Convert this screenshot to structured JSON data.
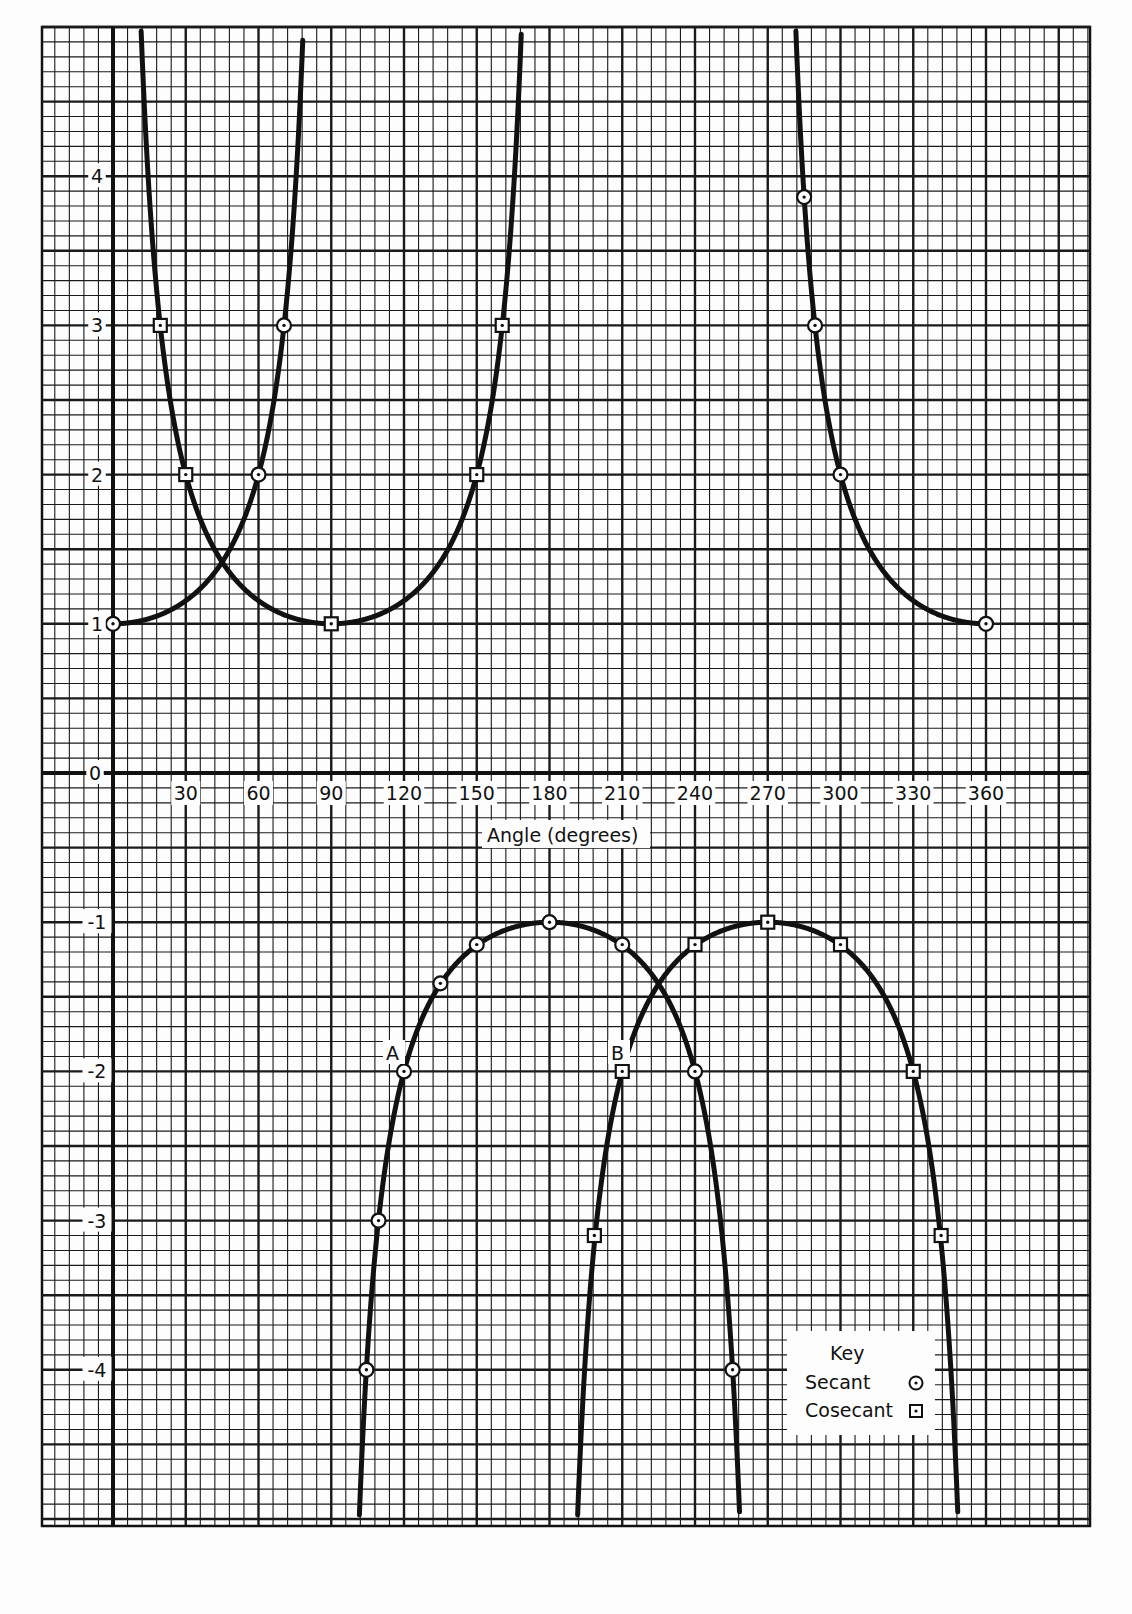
{
  "chart_data": {
    "type": "line",
    "title": "",
    "xlabel": "Angle (degrees)",
    "ylabel": "",
    "xlim": [
      -30,
      390
    ],
    "ylim": [
      -5,
      5
    ],
    "grid": true,
    "x_ticks": [
      30,
      60,
      90,
      120,
      150,
      180,
      210,
      240,
      270,
      300,
      330,
      360
    ],
    "y_ticks": [
      4,
      3,
      2,
      1,
      0,
      -1,
      -2,
      -3,
      -4
    ],
    "legend": {
      "title": "Key",
      "position": "lower right",
      "entries": [
        {
          "label": "Secant",
          "marker": "circle-dot"
        },
        {
          "label": "Cosecant",
          "marker": "square-dot"
        }
      ]
    },
    "annotations": [
      {
        "text": "A",
        "x": 120,
        "y": -2
      },
      {
        "text": "B",
        "x": 210,
        "y": -2
      }
    ],
    "series": [
      {
        "name": "Secant",
        "function": "sec(x)",
        "marker": "circle-dot",
        "points": [
          {
            "x": 0,
            "y": 1
          },
          {
            "x": 60,
            "y": 2
          },
          {
            "x": 70.5,
            "y": 3
          },
          {
            "x": 120,
            "y": -2
          },
          {
            "x": 109.5,
            "y": -3
          },
          {
            "x": 104.5,
            "y": -4
          },
          {
            "x": 135,
            "y": -1.41
          },
          {
            "x": 150,
            "y": -1.15
          },
          {
            "x": 180,
            "y": -1
          },
          {
            "x": 210,
            "y": -1.15
          },
          {
            "x": 240,
            "y": -2
          },
          {
            "x": 255.5,
            "y": -4
          },
          {
            "x": 285,
            "y": 3.86
          },
          {
            "x": 289.5,
            "y": 3
          },
          {
            "x": 300,
            "y": 2
          },
          {
            "x": 360,
            "y": 1
          }
        ]
      },
      {
        "name": "Cosecant",
        "function": "csc(x)",
        "marker": "square-dot",
        "points": [
          {
            "x": 19.5,
            "y": 3
          },
          {
            "x": 30,
            "y": 2
          },
          {
            "x": 90,
            "y": 1
          },
          {
            "x": 150,
            "y": 2
          },
          {
            "x": 160.5,
            "y": 3
          },
          {
            "x": 210,
            "y": -2
          },
          {
            "x": 198.5,
            "y": -3.1
          },
          {
            "x": 240,
            "y": -1.15
          },
          {
            "x": 270,
            "y": -1
          },
          {
            "x": 300,
            "y": -1.15
          },
          {
            "x": 330,
            "y": -2
          },
          {
            "x": 341.5,
            "y": -3.1
          }
        ]
      }
    ]
  },
  "axis": {
    "x_title": "Angle (degrees)",
    "zero_label": "0"
  },
  "legend": {
    "title": "Key",
    "secant_label": "Secant",
    "cosecant_label": "Cosecant"
  },
  "annotations": {
    "a": "A",
    "b": "B"
  }
}
